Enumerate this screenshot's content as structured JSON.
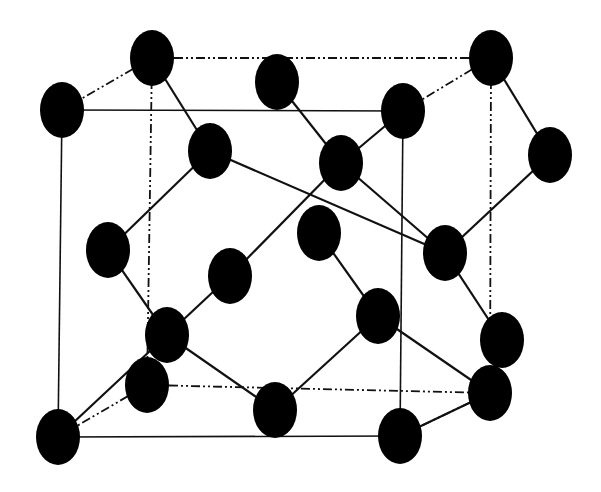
{
  "diagram": {
    "type": "crystal-lattice-unit-cell",
    "colors": {
      "background": "#ffffff",
      "atom": "#000000",
      "line": "#111111"
    },
    "atom_radius": {
      "rx": 22,
      "ry": 28
    },
    "atoms": [
      {
        "id": "a1",
        "x": 62,
        "y": 110
      },
      {
        "id": "a2",
        "x": 152,
        "y": 58
      },
      {
        "id": "a3",
        "x": 277,
        "y": 82
      },
      {
        "id": "a4",
        "x": 491,
        "y": 58
      },
      {
        "id": "a5",
        "x": 403,
        "y": 111
      },
      {
        "id": "a6",
        "x": 210,
        "y": 151
      },
      {
        "id": "a7",
        "x": 341,
        "y": 163
      },
      {
        "id": "a8",
        "x": 550,
        "y": 155
      },
      {
        "id": "a9",
        "x": 108,
        "y": 250
      },
      {
        "id": "a10",
        "x": 319,
        "y": 233
      },
      {
        "id": "a11",
        "x": 445,
        "y": 253
      },
      {
        "id": "a12",
        "x": 230,
        "y": 276
      },
      {
        "id": "a13",
        "x": 378,
        "y": 316
      },
      {
        "id": "a14",
        "x": 167,
        "y": 335
      },
      {
        "id": "a15",
        "x": 502,
        "y": 340
      },
      {
        "id": "a16",
        "x": 147,
        "y": 385
      },
      {
        "id": "a17",
        "x": 275,
        "y": 410
      },
      {
        "id": "a18",
        "x": 490,
        "y": 393
      },
      {
        "id": "a19",
        "x": 58,
        "y": 437
      },
      {
        "id": "a20",
        "x": 400,
        "y": 436
      }
    ],
    "cube_edges_solid": [
      [
        "a1",
        "a5"
      ],
      [
        "a1",
        "a19"
      ],
      [
        "a19",
        "a20"
      ],
      [
        "a5",
        "a20"
      ]
    ],
    "cube_edges_hidden": [
      [
        "a2",
        "a4"
      ],
      [
        "a2",
        "a1"
      ],
      [
        "a4",
        "a5"
      ],
      [
        "a2",
        "a16"
      ],
      [
        "a4",
        "a18"
      ],
      [
        "a16",
        "a18"
      ],
      [
        "a16",
        "a19"
      ],
      [
        "a18",
        "a20"
      ]
    ],
    "bonds": [
      [
        "a2",
        "a6"
      ],
      [
        "a6",
        "a9"
      ],
      [
        "a6",
        "a11"
      ],
      [
        "a3",
        "a7"
      ],
      [
        "a7",
        "a5"
      ],
      [
        "a7",
        "a12"
      ],
      [
        "a7",
        "a11"
      ],
      [
        "a4",
        "a8"
      ],
      [
        "a8",
        "a11"
      ],
      [
        "a9",
        "a14"
      ],
      [
        "a12",
        "a14"
      ],
      [
        "a14",
        "a19"
      ],
      [
        "a14",
        "a17"
      ],
      [
        "a10",
        "a13"
      ],
      [
        "a13",
        "a17"
      ],
      [
        "a13",
        "a18"
      ],
      [
        "a11",
        "a15"
      ],
      [
        "a15",
        "a18"
      ],
      [
        "a18",
        "a20"
      ]
    ]
  }
}
